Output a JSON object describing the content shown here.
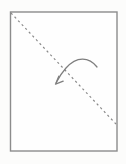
{
  "diagram": {
    "kind": "origami-fold-step",
    "background": "#fcfcfb",
    "canvas": {
      "width": 126,
      "height": 164
    },
    "paper": {
      "x": 10.5,
      "y": 12,
      "width": 106.5,
      "height": 139,
      "fill": "#fefefe",
      "stroke": "#8c8c8c",
      "stroke_width": 1.4
    },
    "fold_line": {
      "style": "dashed",
      "x1": 11,
      "y1": 13,
      "x2": 116,
      "y2": 124,
      "stroke": "#8a8a8a",
      "dash": "2.2 3",
      "stroke_width": 1.2
    },
    "fold_arrow": {
      "arc_path": "M 97 67 C 89 56.5, 76.5 56, 66 68 C 62 72.5, 58.8 77.5, 56.3 82.5",
      "head_path": "M 55.5 84.2 L 58.8 76.2 M 55.5 84.2 L 63.2 81.2",
      "stroke": "#7e7e7e",
      "stroke_width": 1.25
    }
  }
}
